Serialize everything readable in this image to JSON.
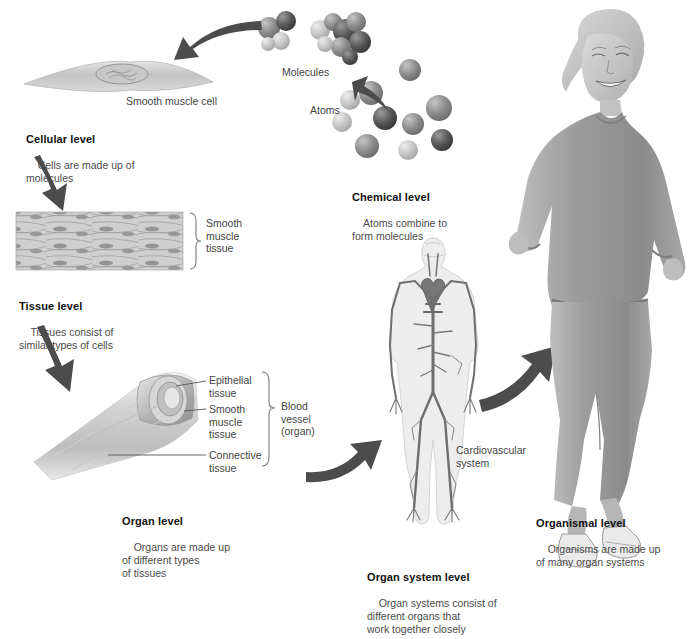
{
  "figure": {
    "type": "biology-diagram"
  },
  "levels": [
    {
      "id": "chemical",
      "heading": "Chemical level",
      "body": "Atoms combine to\nform molecules",
      "labels": [
        "Molecules",
        "Atoms"
      ]
    },
    {
      "id": "cellular",
      "heading": "Cellular level",
      "body": "Cells are made up of\nmolecules",
      "labels": [
        "Smooth muscle cell"
      ]
    },
    {
      "id": "tissue",
      "heading": "Tissue level",
      "body": "Tissues consist of\nsimilar types of cells",
      "labels": [
        "Smooth\nmuscle\ntissue"
      ]
    },
    {
      "id": "organ",
      "heading": "Organ level",
      "body": "Organs are made up\nof different types\nof tissues",
      "labels": [
        "Epithelial\ntissue",
        "Smooth\nmuscle\ntissue",
        "Connective\ntissue",
        "Blood\nvessel\n(organ)"
      ]
    },
    {
      "id": "organ-system",
      "heading": "Organ system level",
      "body": "Organ systems consist of\ndifferent organs that\nwork together closely",
      "labels": [
        "Cardiovascular\nsystem"
      ]
    },
    {
      "id": "organismal",
      "heading": "Organismal level",
      "body": "Organisms are made up\nof many organ systems",
      "labels": []
    }
  ],
  "text": {
    "molecules_label": "Molecules",
    "atoms_label": "Atoms",
    "chemical_heading": "Chemical level",
    "chemical_body": "Atoms combine to\nform molecules",
    "smooth_muscle_cell_label": "Smooth muscle cell",
    "cellular_heading": "Cellular level",
    "cellular_body": "Cells are made up of\nmolecules",
    "smooth_muscle_tissue_label": "Smooth\nmuscle\ntissue",
    "tissue_heading": "Tissue level",
    "tissue_body": "Tissues consist of\nsimilar types of cells",
    "epithelial_tissue_label": "Epithelial\ntissue",
    "organ_smooth_muscle_label": "Smooth\nmuscle\ntissue",
    "connective_tissue_label": "Connective\ntissue",
    "blood_vessel_label": "Blood\nvessel\n(organ)",
    "organ_heading": "Organ level",
    "organ_body": "Organs are made up\nof different types\nof tissues",
    "cardiovascular_label": "Cardiovascular\nsystem",
    "organ_system_heading": "Organ system level",
    "organ_system_body": "Organ systems consist of\ndifferent organs that\nwork together closely",
    "organismal_heading": "Organismal level",
    "organismal_body": "Organisms are made up\nof many organ systems"
  },
  "colors": {
    "background": "#ffffff",
    "arrow": "#4c4c4c",
    "heading": "#111111",
    "body_text": "#4a4a4a",
    "label_text": "#444444",
    "bracket": "#7a7a7a",
    "atom_dark": "#4e4e4e",
    "atom_mid": "#8d8d8d",
    "atom_light": "#c9c9c9",
    "tissue_gray": "#b9b9b9",
    "vessel_gray": "#cfcfcf",
    "figure_gray": "#9a9a9a"
  }
}
